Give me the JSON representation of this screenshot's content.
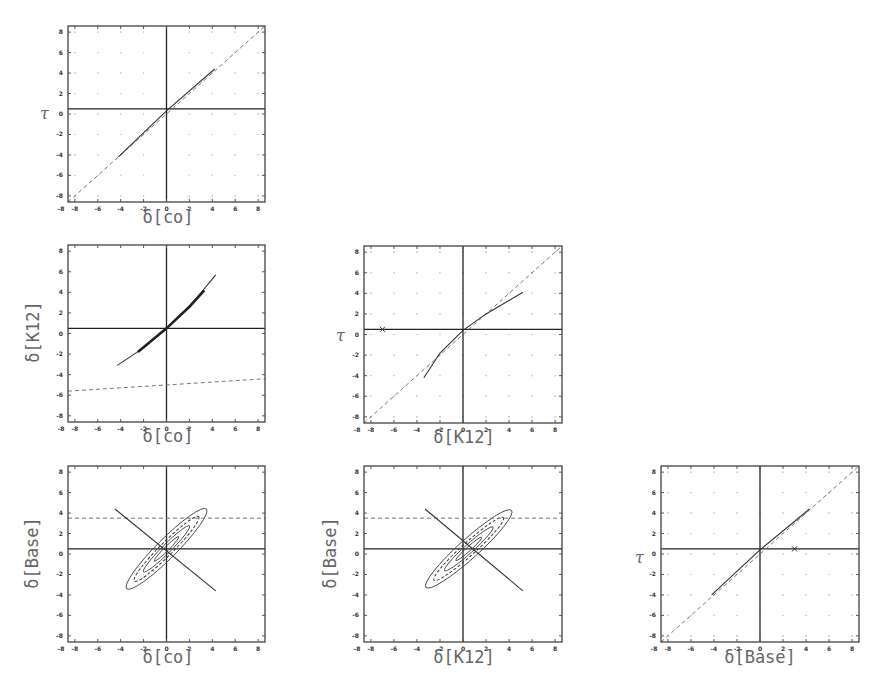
{
  "figure": {
    "axis_range": [
      -8.6,
      8.6
    ],
    "tick_values": [
      -8,
      -6,
      -4,
      -2,
      0,
      2,
      4,
      6,
      8
    ],
    "tick_labels": [
      "-8",
      "-6",
      "-4",
      "-2",
      "0",
      "2",
      "4",
      "6",
      "8"
    ],
    "reference_line_y": 0.5,
    "reference_line_x": 0
  },
  "chart_data": [
    {
      "id": "panel-co-tau",
      "type": "line",
      "xlabel": "δ[co]",
      "ylabel": "τ",
      "xlim": [
        -8.6,
        8.6
      ],
      "ylim": [
        -8.6,
        8.6
      ],
      "grid": "dotted",
      "series": [
        {
          "name": "identity (dashed)",
          "style": "dashed",
          "x": [
            -8.6,
            8.6
          ],
          "y": [
            -8.6,
            8.6
          ]
        },
        {
          "name": "trace",
          "style": "solid",
          "x": [
            -4.2,
            0,
            4.2
          ],
          "y": [
            -4.2,
            0.3,
            4.4
          ]
        }
      ],
      "reference_lines": {
        "horizontal": 0.5,
        "vertical": 0
      }
    },
    {
      "id": "panel-co-k12",
      "type": "line",
      "xlabel": "δ[co]",
      "ylabel": "δ[K12]",
      "xlim": [
        -8.6,
        8.6
      ],
      "ylim": [
        -8.6,
        8.6
      ],
      "series": [
        {
          "name": "curve",
          "style": "solid-thick",
          "x": [
            -4.3,
            -2,
            0,
            2,
            4.3
          ],
          "y": [
            -3.1,
            -1.4,
            0.5,
            2.6,
            5.7
          ]
        },
        {
          "name": "dashed",
          "style": "dashed",
          "x": [
            -8.6,
            0,
            8.6
          ],
          "y": [
            -5.6,
            -5.0,
            -4.4
          ]
        }
      ],
      "reference_lines": {
        "horizontal": 0.5,
        "vertical": 0
      }
    },
    {
      "id": "panel-k12-tau",
      "type": "line",
      "xlabel": "δ[K12]",
      "ylabel": "τ",
      "xlim": [
        -8.6,
        8.6
      ],
      "ylim": [
        -8.6,
        8.6
      ],
      "grid": "dotted",
      "series": [
        {
          "name": "identity (dashed)",
          "style": "dashed",
          "x": [
            -8.6,
            8.6
          ],
          "y": [
            -8.6,
            8.6
          ]
        },
        {
          "name": "trace",
          "style": "solid",
          "x": [
            -3.4,
            -2,
            0,
            2,
            5.2
          ],
          "y": [
            -4.2,
            -1.8,
            0.4,
            2.0,
            4.1
          ]
        }
      ],
      "markers": [
        {
          "x": -7.0,
          "y": 0.5,
          "symbol": "x"
        }
      ],
      "reference_lines": {
        "horizontal": 0.5,
        "vertical": 0
      }
    },
    {
      "id": "panel-co-base",
      "type": "line",
      "xlabel": "δ[co]",
      "ylabel": "δ[Base]",
      "xlim": [
        -8.6,
        8.6
      ],
      "ylim": [
        -8.6,
        8.6
      ],
      "series": [
        {
          "name": "contours (nested ellipses)",
          "style": "solid",
          "center": [
            0,
            0.5
          ],
          "angle_deg": -45,
          "semi_axes": [
            [
              5.2,
              0.9
            ],
            [
              4.2,
              0.6
            ],
            [
              3.0,
              0.4
            ]
          ]
        },
        {
          "name": "dashed",
          "style": "dashed",
          "x": [
            -8.6,
            8.6
          ],
          "y": [
            3.5,
            3.5
          ]
        },
        {
          "name": "regression",
          "style": "solid",
          "x": [
            -4.5,
            4.3
          ],
          "y": [
            4.4,
            -3.6
          ]
        }
      ],
      "reference_lines": {
        "horizontal": 0.5,
        "vertical": 0
      }
    },
    {
      "id": "panel-k12-base",
      "type": "line",
      "xlabel": "δ[K12]",
      "ylabel": "δ[Base]",
      "xlim": [
        -8.6,
        8.6
      ],
      "ylim": [
        -8.6,
        8.6
      ],
      "series": [
        {
          "name": "contours (nested ellipses)",
          "style": "solid",
          "center": [
            0.5,
            0.5
          ],
          "angle_deg": -42,
          "semi_axes": [
            [
              5.3,
              0.9
            ],
            [
              4.3,
              0.6
            ],
            [
              3.0,
              0.4
            ]
          ]
        },
        {
          "name": "dashed",
          "style": "dashed",
          "x": [
            -8.6,
            8.6
          ],
          "y": [
            3.5,
            3.5
          ]
        },
        {
          "name": "regression",
          "style": "solid",
          "x": [
            -3.3,
            5.2
          ],
          "y": [
            4.4,
            -3.6
          ]
        }
      ],
      "reference_lines": {
        "horizontal": 0.5,
        "vertical": 0
      }
    },
    {
      "id": "panel-base-tau",
      "type": "line",
      "xlabel": "δ[Base]",
      "ylabel": "τ",
      "xlim": [
        -8.6,
        8.6
      ],
      "ylim": [
        -8.6,
        8.6
      ],
      "grid": "dotted",
      "series": [
        {
          "name": "identity (dashed)",
          "style": "dashed",
          "x": [
            -8.6,
            8.6
          ],
          "y": [
            -8.6,
            8.6
          ]
        },
        {
          "name": "trace",
          "style": "solid",
          "x": [
            -4.2,
            0,
            4.3
          ],
          "y": [
            -4.0,
            0.4,
            4.4
          ]
        }
      ],
      "markers": [
        {
          "x": 3.0,
          "y": 0.5,
          "symbol": "x"
        }
      ],
      "reference_lines": {
        "horizontal": 0.5,
        "vertical": 0
      }
    }
  ],
  "labels": {
    "co": "δ[co]",
    "k12": "δ[K12]",
    "base": "δ[Base]",
    "tau": "τ"
  }
}
